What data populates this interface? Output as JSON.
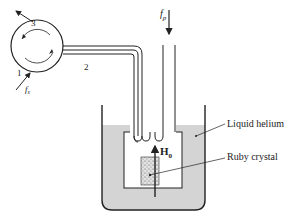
{
  "diagram": {
    "circulator": {
      "ports": [
        "1",
        "2",
        "3"
      ],
      "input_signal": "f",
      "input_signal_sub": "s"
    },
    "pump": {
      "label": "f",
      "label_sub": "p"
    },
    "field": {
      "label": "H",
      "label_sub": "0"
    },
    "labels": {
      "liquid_helium": "Liquid helium",
      "ruby_crystal": "Ruby crystal"
    },
    "colors": {
      "stroke": "#222222",
      "helium": "#d4d4d4",
      "ruby": "#cfcfcf",
      "background": "#ffffff"
    }
  }
}
